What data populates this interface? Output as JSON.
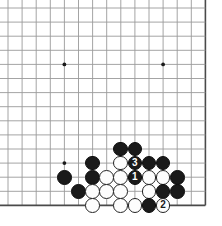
{
  "figure": {
    "kind": "go-board-diagram",
    "board_size": 19,
    "visible_region": "bottom-left corner area",
    "colors": {
      "background": "#ffffff",
      "grid_line": "#9a9a9a",
      "edge_line": "#4a4a4a",
      "black_stone": "#1a1a1a",
      "white_stone": "#fdfdfd",
      "stone_outline": "#232323",
      "black_label_text": "#ffffff",
      "white_label_text": "#1a1a1a"
    }
  },
  "board": {
    "origin_x": 8,
    "origin_y": 8,
    "spacing": 14.1,
    "cols": 15,
    "rows": 15,
    "edges": {
      "bottom_row_index": 14,
      "right_col_index": 14
    },
    "star_points": [
      {
        "col": 4,
        "row": 4
      },
      {
        "col": 11,
        "row": 4
      },
      {
        "col": 4,
        "row": 11
      }
    ]
  },
  "stones": [
    {
      "col": 8,
      "row": 10,
      "color": "black",
      "label": ""
    },
    {
      "col": 9,
      "row": 10,
      "color": "black",
      "label": ""
    },
    {
      "col": 6,
      "row": 11,
      "color": "black",
      "label": ""
    },
    {
      "col": 8,
      "row": 11,
      "color": "white",
      "label": ""
    },
    {
      "col": 9,
      "row": 11,
      "color": "black",
      "label": "3"
    },
    {
      "col": 10,
      "row": 11,
      "color": "black",
      "label": ""
    },
    {
      "col": 11,
      "row": 11,
      "color": "black",
      "label": ""
    },
    {
      "col": 4,
      "row": 12,
      "color": "black",
      "label": ""
    },
    {
      "col": 6,
      "row": 12,
      "color": "black",
      "label": ""
    },
    {
      "col": 7,
      "row": 12,
      "color": "white",
      "label": ""
    },
    {
      "col": 8,
      "row": 12,
      "color": "white",
      "label": ""
    },
    {
      "col": 9,
      "row": 12,
      "color": "black",
      "label": "1"
    },
    {
      "col": 10,
      "row": 12,
      "color": "white",
      "label": ""
    },
    {
      "col": 11,
      "row": 12,
      "color": "white",
      "label": ""
    },
    {
      "col": 12,
      "row": 12,
      "color": "black",
      "label": ""
    },
    {
      "col": 5,
      "row": 13,
      "color": "black",
      "label": ""
    },
    {
      "col": 6,
      "row": 13,
      "color": "white",
      "label": ""
    },
    {
      "col": 7,
      "row": 13,
      "color": "white",
      "label": ""
    },
    {
      "col": 8,
      "row": 13,
      "color": "white",
      "label": ""
    },
    {
      "col": 10,
      "row": 13,
      "color": "white",
      "label": ""
    },
    {
      "col": 11,
      "row": 13,
      "color": "black",
      "label": ""
    },
    {
      "col": 12,
      "row": 13,
      "color": "black",
      "label": ""
    },
    {
      "col": 6,
      "row": 14,
      "color": "white",
      "label": ""
    },
    {
      "col": 8,
      "row": 14,
      "color": "white",
      "label": ""
    },
    {
      "col": 9,
      "row": 14,
      "color": "white",
      "label": ""
    },
    {
      "col": 10,
      "row": 14,
      "color": "black",
      "label": ""
    },
    {
      "col": 11,
      "row": 14,
      "color": "white",
      "label": "2"
    }
  ],
  "move_labels": {
    "move_1": "1",
    "move_2": "2",
    "move_3": "3"
  }
}
